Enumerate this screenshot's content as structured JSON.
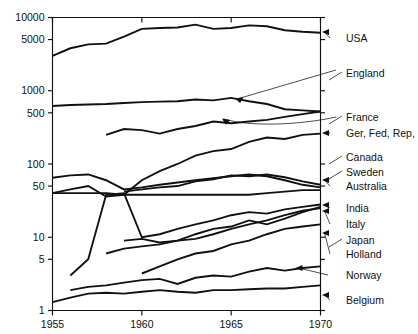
{
  "chart_data": {
    "type": "line",
    "title": "",
    "xlabel": "",
    "ylabel": "",
    "yscale": "log",
    "ylim": [
      1,
      10000
    ],
    "xlim": [
      1955,
      1970
    ],
    "grid": false,
    "legend_position": "right-labels-with-arrows",
    "xtick_labels": [
      "1955",
      "1960",
      "1965",
      "1970"
    ],
    "xticks": [
      1955,
      1960,
      1965,
      1970
    ],
    "ytick_labels": [
      "10000",
      "5000",
      "1000",
      "500",
      "100",
      "50",
      "10",
      "5",
      "1"
    ],
    "yticks": [
      10000,
      5000,
      1000,
      500,
      100,
      50,
      10,
      5,
      1
    ],
    "x": [
      1955,
      1956,
      1957,
      1958,
      1959,
      1960,
      1961,
      1962,
      1963,
      1964,
      1965,
      1966,
      1967,
      1968,
      1969,
      1970
    ],
    "series": [
      {
        "name": "USA",
        "x": [
          1955,
          1956,
          1957,
          1958,
          1959,
          1960,
          1961,
          1962,
          1963,
          1964,
          1965,
          1966,
          1967,
          1968,
          1969,
          1970
        ],
        "values": [
          3000,
          3800,
          4300,
          4400,
          5500,
          7000,
          7200,
          7300,
          8000,
          7000,
          7200,
          7800,
          7600,
          6700,
          6400,
          6200
        ]
      },
      {
        "name": "England",
        "x": [
          1955,
          1956,
          1957,
          1958,
          1959,
          1960,
          1961,
          1962,
          1963,
          1964,
          1965,
          1966,
          1967,
          1968,
          1969,
          1970
        ],
        "values": [
          620,
          640,
          650,
          660,
          680,
          700,
          710,
          720,
          760,
          740,
          800,
          720,
          660,
          560,
          540,
          520
        ]
      },
      {
        "name": "France",
        "x": [
          1958,
          1959,
          1960,
          1961,
          1962,
          1963,
          1964,
          1965,
          1966,
          1967,
          1968,
          1969,
          1970
        ],
        "values": [
          250,
          300,
          290,
          260,
          300,
          330,
          380,
          360,
          380,
          400,
          440,
          480,
          520
        ]
      },
      {
        "name": "Ger, Fed, Rep,",
        "x": [
          1955,
          1956,
          1957,
          1958,
          1959,
          1960,
          1961,
          1962,
          1963,
          1964,
          1965,
          1966,
          1967,
          1968,
          1969,
          1970
        ],
        "values": [
          40,
          45,
          50,
          36,
          38,
          60,
          80,
          100,
          130,
          150,
          160,
          200,
          230,
          220,
          250,
          260
        ]
      },
      {
        "name": "Canada",
        "x": [
          1959,
          1960,
          1961,
          1962,
          1963,
          1964,
          1965,
          1966,
          1967,
          1968,
          1969,
          1970
        ],
        "values": [
          42,
          45,
          48,
          50,
          58,
          62,
          70,
          68,
          72,
          66,
          58,
          52
        ]
      },
      {
        "name": "Sweden",
        "x": [
          1955,
          1956,
          1957,
          1958,
          1959,
          1960,
          1961,
          1962,
          1963,
          1964,
          1965,
          1966,
          1967,
          1968,
          1969,
          1970
        ],
        "values": [
          65,
          70,
          72,
          60,
          45,
          48,
          52,
          56,
          60,
          64,
          68,
          72,
          68,
          60,
          52,
          48
        ]
      },
      {
        "name": "Australia",
        "x": [
          1955,
          1956,
          1957,
          1958,
          1959,
          1960,
          1961,
          1962,
          1963,
          1964,
          1965,
          1966,
          1967,
          1968,
          1969,
          1970
        ],
        "values": [
          40,
          40,
          40,
          40,
          38,
          38,
          38,
          38,
          38,
          38,
          38,
          38,
          40,
          42,
          44,
          44
        ]
      },
      {
        "name": "India",
        "x": [
          1956,
          1957,
          1958,
          1959,
          1960,
          1961,
          1962,
          1963,
          1964,
          1965,
          1966,
          1967,
          1968,
          1969,
          1970
        ],
        "values": [
          3,
          5,
          38,
          40,
          10,
          11,
          13,
          15,
          17,
          20,
          22,
          21,
          24,
          26,
          28
        ]
      },
      {
        "name": "Italy",
        "x": [
          1959,
          1960,
          1961,
          1962,
          1963,
          1964,
          1965,
          1966,
          1967,
          1968,
          1969,
          1970
        ],
        "values": [
          9,
          9.5,
          8.5,
          9,
          11,
          13,
          14,
          17,
          15,
          18,
          22,
          26
        ]
      },
      {
        "name": "Japan",
        "x": [
          1958,
          1959,
          1960,
          1961,
          1962,
          1963,
          1964,
          1965,
          1966,
          1967,
          1968,
          1969,
          1970
        ],
        "values": [
          6,
          7,
          7.5,
          8,
          9,
          9.5,
          11,
          13,
          15,
          17,
          20,
          23,
          25
        ]
      },
      {
        "name": "Holland",
        "x": [
          1960,
          1961,
          1962,
          1963,
          1964,
          1965,
          1966,
          1967,
          1968,
          1969,
          1970
        ],
        "values": [
          3.2,
          4,
          5,
          6,
          6.5,
          8,
          9,
          11,
          13,
          14,
          15
        ]
      },
      {
        "name": "Norway",
        "x": [
          1956,
          1957,
          1958,
          1959,
          1960,
          1961,
          1962,
          1963,
          1964,
          1965,
          1966,
          1967,
          1968,
          1969,
          1970
        ],
        "values": [
          1.9,
          2.1,
          2.2,
          2.4,
          2.6,
          2.7,
          2.3,
          2.8,
          3.0,
          2.9,
          3.4,
          3.8,
          3.5,
          3.8,
          4.0
        ]
      },
      {
        "name": "Belgium",
        "x": [
          1955,
          1956,
          1957,
          1958,
          1959,
          1960,
          1961,
          1962,
          1963,
          1964,
          1965,
          1966,
          1967,
          1968,
          1969,
          1970
        ],
        "values": [
          1.3,
          1.5,
          1.7,
          1.75,
          1.7,
          1.8,
          1.9,
          1.8,
          1.75,
          1.9,
          1.9,
          1.95,
          2.0,
          2.0,
          2.1,
          2.2
        ]
      }
    ],
    "right_labels": [
      {
        "label": "USA",
        "marker": "arrow"
      },
      {
        "label": "England",
        "marker": "leader"
      },
      {
        "label": "France",
        "marker": "leader"
      },
      {
        "label": "Ger, Fed, Rep,",
        "marker": "arrow"
      },
      {
        "label": "Canada",
        "marker": "leader"
      },
      {
        "label": "Sweden",
        "marker": "leader"
      },
      {
        "label": "Australia",
        "marker": "arrow"
      },
      {
        "label": "India",
        "marker": "arrow"
      },
      {
        "label": "Italy",
        "marker": "arrow"
      },
      {
        "label": "Japan",
        "marker": "leader"
      },
      {
        "label": "Holland",
        "marker": "arrow"
      },
      {
        "label": "Norway",
        "marker": "line"
      },
      {
        "label": "Belgium",
        "marker": "arrow"
      }
    ]
  }
}
